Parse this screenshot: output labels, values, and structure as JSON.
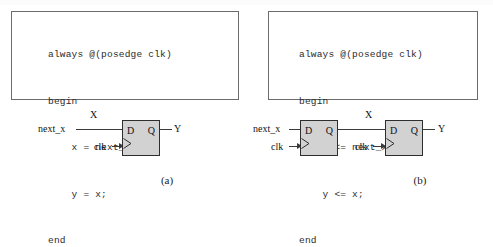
{
  "figure": {
    "caption": "",
    "panels": [
      {
        "id": "a",
        "subcaption": "(a)",
        "code": {
          "lines": [
            "always @(posedge clk)",
            "begin",
            "    x = next_x;",
            "    y = x;",
            "end"
          ]
        },
        "circuit": {
          "signals": {
            "input": "next_x",
            "internal": "X",
            "clock": "clk",
            "output": "Y"
          },
          "flipflops": [
            {
              "d": "D",
              "q": "Q",
              "clock": "clk"
            }
          ]
        }
      },
      {
        "id": "b",
        "subcaption": "(b)",
        "code": {
          "lines": [
            "always @(posedge clk)",
            "begin",
            "    x <= next_x;",
            "    y <= x;",
            "end"
          ]
        },
        "circuit": {
          "signals": {
            "input": "next_x",
            "internal": "X",
            "clock": "clk",
            "clock2": "clk",
            "output": "Y"
          },
          "flipflops": [
            {
              "d": "D",
              "q": "Q",
              "clock": "clk"
            },
            {
              "d": "D",
              "q": "Q",
              "clock": "clk"
            }
          ]
        }
      }
    ]
  },
  "colors": {
    "box_border": "#6b6b6b",
    "ff_fill": "#d2d2d2",
    "ff_border": "#2e2e2e",
    "wire": "#3a3a3a",
    "text": "#1a1a1a",
    "background": "#ffffff"
  }
}
